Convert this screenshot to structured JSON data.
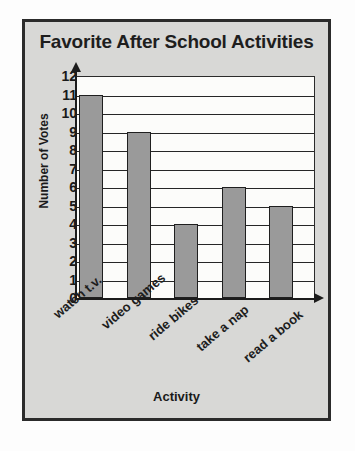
{
  "chart_data": {
    "type": "bar",
    "title": "Favorite After School Activities",
    "xlabel": "Activity",
    "ylabel": "Number of Votes",
    "categories": [
      "watch t.v.",
      "video games",
      "ride bikes",
      "take a nap",
      "read a book"
    ],
    "values": [
      11,
      9,
      4,
      6,
      5
    ],
    "ylim": [
      0,
      12
    ],
    "ytick_labels": [
      "12",
      "11",
      "10",
      "9",
      "8",
      "7",
      "6",
      "5",
      "4",
      "3",
      "2",
      "1",
      "0"
    ],
    "ytick_values": [
      12,
      11,
      10,
      9,
      8,
      7,
      6,
      5,
      4,
      3,
      2,
      1,
      0
    ],
    "grid": "horizontal",
    "legend": "none",
    "bar_color": "#9a9a9a",
    "bar_border_color": "#1f1f1f",
    "axis_color": "#1c1c1c",
    "plot_background": "#fcfcfa",
    "frame_background": "#d8d8d6",
    "title_color": "#1e1e1e"
  }
}
